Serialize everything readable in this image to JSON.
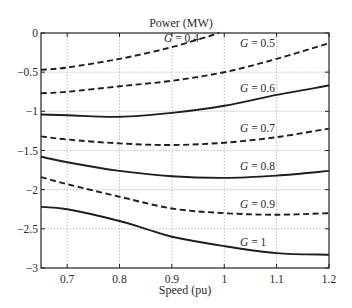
{
  "chart_data": {
    "type": "line",
    "title": "Power (MW)",
    "xlabel": "Speed (pu)",
    "ylabel": "",
    "xlim": [
      0.65,
      1.2
    ],
    "ylim": [
      -3,
      0
    ],
    "grid": true,
    "grid_style": "dotted",
    "legend": "inline labels",
    "x_ticks": [
      0.7,
      0.8,
      0.9,
      1.0,
      1.1,
      1.2
    ],
    "x_tick_labels": [
      "0.7",
      "0.8",
      "0.9",
      "1",
      "1.1",
      "1.2"
    ],
    "y_ticks": [
      0,
      -0.5,
      -1,
      -1.5,
      -2,
      -2.5,
      -3
    ],
    "y_tick_labels": [
      "0",
      "−0.5",
      "−1",
      "−1.5",
      "−2",
      "−2.5",
      "−3"
    ],
    "series": [
      {
        "name": "G = 0.4",
        "style": "dashed",
        "x": [
          0.65,
          0.7,
          0.8,
          0.9,
          0.99
        ],
        "values": [
          -0.47,
          -0.44,
          -0.33,
          -0.18,
          0.0
        ]
      },
      {
        "name": "G = 0.5",
        "style": "dashed",
        "x": [
          0.65,
          0.7,
          0.8,
          0.9,
          1.0,
          1.1,
          1.2
        ],
        "values": [
          -0.77,
          -0.75,
          -0.68,
          -0.61,
          -0.5,
          -0.33,
          -0.13
        ]
      },
      {
        "name": "G = 0.6",
        "style": "solid",
        "x": [
          0.65,
          0.7,
          0.8,
          0.9,
          1.0,
          1.1,
          1.2
        ],
        "values": [
          -1.04,
          -1.05,
          -1.07,
          -1.02,
          -0.93,
          -0.79,
          -0.67
        ]
      },
      {
        "name": "G = 0.7",
        "style": "dashed",
        "x": [
          0.65,
          0.7,
          0.8,
          0.9,
          1.0,
          1.1,
          1.2
        ],
        "values": [
          -1.32,
          -1.36,
          -1.41,
          -1.43,
          -1.4,
          -1.33,
          -1.22
        ]
      },
      {
        "name": "G = 0.8",
        "style": "solid",
        "x": [
          0.65,
          0.7,
          0.8,
          0.9,
          1.0,
          1.1,
          1.2
        ],
        "values": [
          -1.58,
          -1.65,
          -1.76,
          -1.83,
          -1.85,
          -1.82,
          -1.76
        ]
      },
      {
        "name": "G = 0.9",
        "style": "dashed",
        "x": [
          0.65,
          0.7,
          0.8,
          0.9,
          1.0,
          1.1,
          1.2
        ],
        "values": [
          -1.84,
          -1.93,
          -2.09,
          -2.24,
          -2.3,
          -2.32,
          -2.3
        ]
      },
      {
        "name": "G = 1",
        "style": "solid",
        "x": [
          0.65,
          0.7,
          0.8,
          0.85,
          0.9,
          1.0,
          1.1,
          1.2
        ],
        "values": [
          -2.22,
          -2.25,
          -2.4,
          -2.5,
          -2.6,
          -2.72,
          -2.81,
          -2.83
        ]
      }
    ],
    "annotations": [
      {
        "text_prefix": "G",
        "text_suffix": " = 0.4",
        "x": 0.885,
        "y": -0.12
      },
      {
        "text_prefix": "G",
        "text_suffix": " = 0.5",
        "x": 1.03,
        "y": -0.18
      },
      {
        "text_prefix": "G",
        "text_suffix": " = 0.6",
        "x": 1.03,
        "y": -0.75
      },
      {
        "text_prefix": "G",
        "text_suffix": " = 0.7",
        "x": 1.03,
        "y": -1.27
      },
      {
        "text_prefix": "G",
        "text_suffix": " = 0.8",
        "x": 1.03,
        "y": -1.75
      },
      {
        "text_prefix": "G",
        "text_suffix": " = 0.9",
        "x": 1.03,
        "y": -2.23
      },
      {
        "text_prefix": "G",
        "text_suffix": " = 1",
        "x": 1.03,
        "y": -2.72
      }
    ]
  },
  "layout": {
    "plot_left": 41,
    "plot_top": 33,
    "plot_right": 329,
    "plot_bottom": 268,
    "line_color": "#1e1e1e",
    "grid_color": "#9a9a9a"
  }
}
